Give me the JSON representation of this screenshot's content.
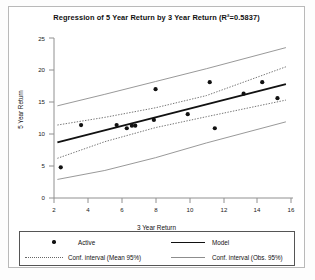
{
  "chart_data": {
    "type": "scatter",
    "title": "Regression of 5 Year Return by 3 Year Return (R²=0.5837)",
    "xlabel": "3 Year Return",
    "ylabel": "5 Year Return",
    "xlim": [
      2,
      16
    ],
    "ylim": [
      0,
      25
    ],
    "xticks": [
      2,
      4,
      6,
      8,
      10,
      12,
      14,
      16
    ],
    "yticks": [
      0,
      5,
      10,
      15,
      20,
      25
    ],
    "grid": false,
    "r_squared": 0.5837,
    "legend_position": "below-plot",
    "series": [
      {
        "name": "Active",
        "style": "points",
        "x": [
          2.4,
          3.6,
          5.7,
          6.3,
          6.6,
          6.8,
          7.9,
          8.0,
          9.9,
          11.2,
          11.5,
          13.2,
          14.3,
          15.2
        ],
        "y": [
          4.8,
          11.4,
          11.4,
          10.9,
          11.3,
          11.3,
          12.2,
          17.0,
          13.1,
          18.1,
          10.9,
          16.3,
          18.1,
          15.6
        ]
      },
      {
        "name": "Model",
        "style": "solid-line",
        "x": [
          2.2,
          15.7
        ],
        "y": [
          8.7,
          17.8
        ]
      },
      {
        "name": "Conf. interval (Mean 95%)",
        "style": "dotted-line",
        "upper_x": [
          2.2,
          5.0,
          8.0,
          11.0,
          15.7
        ],
        "upper_y": [
          11.4,
          12.6,
          14.1,
          16.0,
          20.5
        ],
        "lower_x": [
          2.2,
          5.0,
          8.0,
          11.0,
          15.7
        ],
        "lower_y": [
          6.2,
          8.8,
          11.0,
          12.7,
          15.3
        ]
      },
      {
        "name": "Conf. interval (Obs. 95%)",
        "style": "dashed-line",
        "upper_x": [
          2.2,
          5.0,
          8.0,
          11.0,
          15.7
        ],
        "upper_y": [
          14.4,
          16.2,
          18.2,
          20.2,
          23.5
        ],
        "lower_x": [
          2.2,
          5.0,
          8.0,
          11.0,
          15.7
        ],
        "lower_y": [
          2.9,
          4.3,
          6.3,
          8.6,
          11.9
        ]
      }
    ]
  },
  "chart": {
    "title": "Regression of 5 Year Return by 3 Year Return (R²=0.5837)",
    "x_axis_label": "3 Year Return",
    "y_axis_label": "5 Year Return",
    "x_tick_labels": [
      "2",
      "4",
      "6",
      "8",
      "10",
      "12",
      "14",
      "16"
    ],
    "y_tick_labels": [
      "0",
      "5",
      "10",
      "15",
      "20",
      "25"
    ]
  },
  "legend": {
    "entries": [
      {
        "label": "Active",
        "marker": "dot-marker",
        "color": "#111111"
      },
      {
        "label": "Model",
        "marker": "solid-line",
        "color": "#111111"
      },
      {
        "label": "Conf. interval (Mean 95%)",
        "marker": "dotted-line",
        "color": "#666666"
      },
      {
        "label": "Conf. interval (Obs. 95%)",
        "marker": "dashed-line",
        "color": "#8d8d8d"
      }
    ]
  },
  "colors": {
    "point": "#111111",
    "model_line": "#111111",
    "ci_mean": "#666666",
    "ci_obs": "#8d8d8d",
    "axis": "#808080",
    "frame": "#b9b9b9"
  }
}
